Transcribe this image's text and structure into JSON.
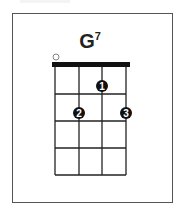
{
  "chord": {
    "name": "G",
    "superscript": "7",
    "strings": 4,
    "frets_shown": 4,
    "open_strings": [
      1
    ],
    "open_marker": "○",
    "fingers": [
      {
        "finger": "1",
        "string": 3,
        "fret": 1
      },
      {
        "finger": "2",
        "string": 2,
        "fret": 2
      },
      {
        "finger": "3",
        "string": 4,
        "fret": 2
      }
    ]
  },
  "colors": {
    "grid": "#222222",
    "nut": "#111111",
    "dot": "#111111",
    "dot_text": "#ffffff",
    "open_marker": "#777777",
    "frame": "#555555"
  }
}
